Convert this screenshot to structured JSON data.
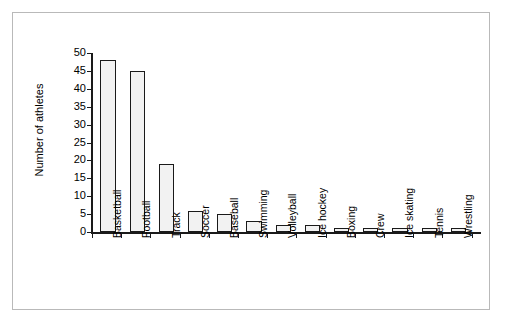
{
  "chart_data": {
    "type": "bar",
    "title": "",
    "subtitle": "",
    "xlabel": "",
    "ylabel": "Number of athletes",
    "ylim": [
      0,
      50
    ],
    "ytick_step": 5,
    "yticks": [
      0,
      5,
      10,
      15,
      20,
      25,
      30,
      35,
      40,
      45,
      50
    ],
    "grid": false,
    "legend": false,
    "legend_position": "none",
    "categories": [
      "Basketball",
      "Football",
      "Track",
      "Soccer",
      "Baseball",
      "Swimming",
      "Volleyball",
      "Ice hockey",
      "Boxing",
      "Crew",
      "Ice skating",
      "Tennis",
      "Wrestling"
    ],
    "values": [
      48,
      45,
      19,
      6,
      5,
      3,
      2,
      2,
      1,
      1,
      1,
      1,
      1
    ],
    "bar_fill_color": "#f2f2f2",
    "bar_edge_color": "#1a1a1a",
    "axis_color": "#1a1a1a",
    "frame_color": "#b9b9b9",
    "background_color": "#ffffff"
  }
}
